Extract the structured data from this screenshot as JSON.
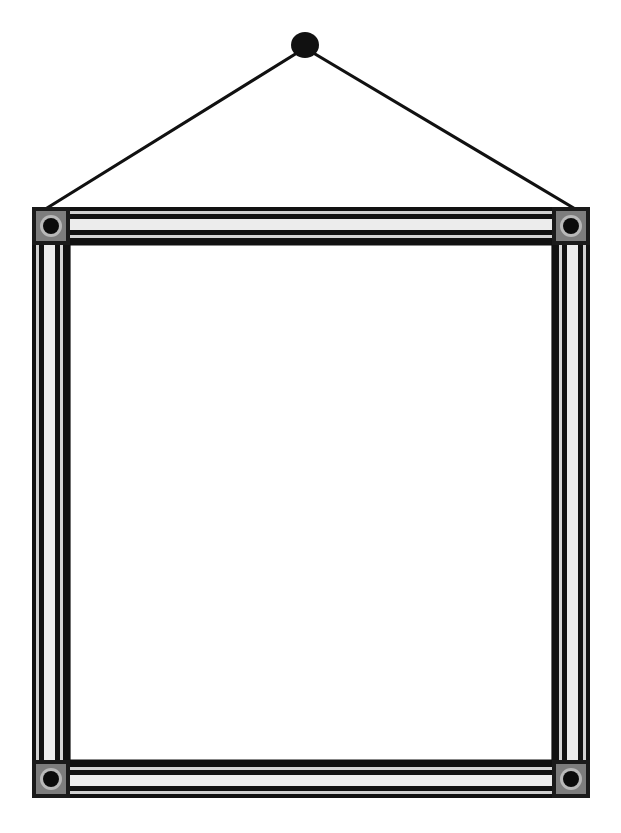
{
  "canvas": {
    "width": 621,
    "height": 833,
    "background": "#ffffff",
    "title": "Hanging picture frame with suspension wire"
  },
  "palette": {
    "black": "#111111",
    "ink": "#000000",
    "white": "#ffffff",
    "light_gray": "#e9e9e9",
    "mid_gray": "#b5b5b5",
    "dark_gray": "#3a3a3a",
    "corner_block": "#1a1a1a",
    "corner_block_inner": "#7d7d7d"
  },
  "hanger": {
    "nail": {
      "name": "nail-head",
      "cx": 305,
      "cy": 45,
      "rx": 14,
      "ry": 13,
      "color": "#111111"
    },
    "wire": {
      "name": "hanging-wire",
      "color": "#111111",
      "thickness": 3.2,
      "left_anchor": {
        "x": 39,
        "y": 213
      },
      "right_anchor": {
        "x": 582,
        "y": 213
      },
      "apex": {
        "x": 305,
        "y": 48
      }
    }
  },
  "frame": {
    "name": "picture-frame",
    "outer": {
      "x": 32,
      "y": 207,
      "width": 558,
      "height": 591
    },
    "rail_thickness": 38,
    "inner_opening": {
      "x": 70,
      "y": 245,
      "width": 482,
      "height": 515
    },
    "profile_bands": [
      {
        "offset": 0,
        "width": 4,
        "color": "#111111"
      },
      {
        "offset": 4,
        "width": 3,
        "color": "#cfcfcf"
      },
      {
        "offset": 7,
        "width": 5,
        "color": "#111111"
      },
      {
        "offset": 12,
        "width": 11,
        "color": "#ececec"
      },
      {
        "offset": 23,
        "width": 5,
        "color": "#111111"
      },
      {
        "offset": 28,
        "width": 3,
        "color": "#d5d5d5"
      },
      {
        "offset": 31,
        "width": 7,
        "color": "#111111"
      }
    ]
  },
  "corners": {
    "name": "corner-bracket",
    "size": 38,
    "block_color": "#1a1a1a",
    "ring_color": "#b8b8b8",
    "hole_color": "#0a0a0a",
    "ring_outer_r": 11,
    "ring_inner_r": 8,
    "items": [
      {
        "name": "corner-bracket-top-left",
        "cx": 51,
        "cy": 226
      },
      {
        "name": "corner-bracket-top-right",
        "cx": 571,
        "cy": 226
      },
      {
        "name": "corner-bracket-bottom-left",
        "cx": 51,
        "cy": 779
      },
      {
        "name": "corner-bracket-bottom-right",
        "cx": 571,
        "cy": 779
      }
    ]
  },
  "mat": {
    "name": "frame-inner-mat",
    "color": "#ffffff"
  }
}
